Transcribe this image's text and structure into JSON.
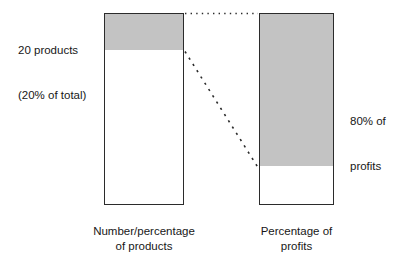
{
  "figure": {
    "background_color": "#ffffff",
    "shaded_fill_color": "#c3c3c3",
    "outline_color": "#2b2b2b",
    "text_color": "#171717"
  },
  "chart_data": {
    "type": "bar",
    "title": "",
    "xlabel": "",
    "ylabel": "",
    "categories": [
      "Number/percentage of products",
      "Percentage of profits"
    ],
    "series": [
      {
        "name": "Highlighted (shaded) share",
        "values": [
          20,
          80
        ]
      },
      {
        "name": "Remainder (unshaded) share",
        "values": [
          80,
          20
        ]
      }
    ],
    "ylim": [
      0,
      100
    ],
    "grid": false,
    "legend": "none",
    "stacked": true,
    "annotations": [
      "20 products (20% of total) of the products bar is shaded",
      "80% of profits of the profits bar is shaded",
      "Dotted line links the tops of both bars",
      "Dashed line links the shaded/unshaded boundary of the products bar to the shaded/unshaded boundary of the profits bar"
    ]
  },
  "bars": {
    "products": {
      "caption_line1": "Number/percentage",
      "caption_line2": "of products",
      "shaded_percent": 20,
      "unshaded_percent": 80
    },
    "profits": {
      "caption_line1": "Percentage of",
      "caption_line2": "profits",
      "shaded_percent": 80,
      "unshaded_percent": 20
    }
  },
  "callouts": {
    "products": {
      "line1": "20 products",
      "line2": "(20% of total)"
    },
    "profits": {
      "line1": "80% of",
      "line2": "profits"
    }
  },
  "connectors": {
    "top_link_style": "dotted",
    "diagonal_link_style": "dashed"
  }
}
